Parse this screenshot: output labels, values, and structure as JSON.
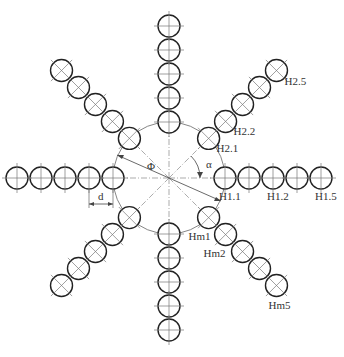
{
  "diagram": {
    "type": "radial sensor/hole layout",
    "center": [
      169,
      178
    ],
    "inner_circle_radius": 56,
    "hole_radius": 11,
    "hole_spacing": 24,
    "stroke_color": "#222222",
    "centerline_color": "#888888",
    "arms": [
      {
        "name": "east",
        "angle": 0,
        "count": 5,
        "labels": [
          {
            "text": "H1.1",
            "index": 0
          },
          {
            "text": "H1.2",
            "index": 2
          },
          {
            "text": "H1.5",
            "index": 4
          }
        ]
      },
      {
        "name": "northeast",
        "angle": 45,
        "count": 5,
        "labels": [
          {
            "text": "H2.1",
            "index": 0
          },
          {
            "text": "H2.2",
            "index": 1
          },
          {
            "text": "H2.5",
            "index": 4
          }
        ]
      },
      {
        "name": "north",
        "angle": 90,
        "count": 5,
        "labels": []
      },
      {
        "name": "northwest",
        "angle": 135,
        "count": 5,
        "labels": []
      },
      {
        "name": "west",
        "angle": 180,
        "count": 5,
        "labels": []
      },
      {
        "name": "southwest",
        "angle": 225,
        "count": 5,
        "labels": []
      },
      {
        "name": "south",
        "angle": 270,
        "count": 5,
        "labels": []
      },
      {
        "name": "southeast",
        "angle": 315,
        "count": 5,
        "labels": [
          {
            "text": "Hm1",
            "index": 0
          },
          {
            "text": "Hm2",
            "index": 1
          },
          {
            "text": "Hm5",
            "index": 4
          }
        ]
      }
    ],
    "annotations": {
      "phi": "Φ",
      "alpha": "α",
      "d": "d"
    }
  }
}
